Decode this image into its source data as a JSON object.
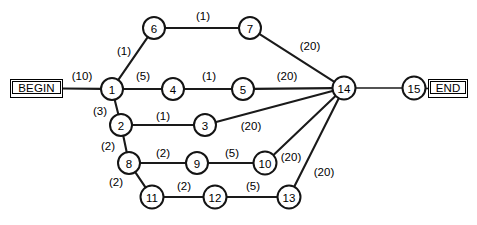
{
  "diagram": {
    "terminals": {
      "begin": {
        "label": "BEGIN",
        "x": 10,
        "y": 79,
        "w": 53,
        "h": 19
      },
      "end": {
        "label": "END",
        "x": 428,
        "y": 79,
        "w": 40,
        "h": 19
      }
    },
    "nodes": [
      {
        "id": "1",
        "label": "1",
        "x": 112,
        "y": 89,
        "r": 11
      },
      {
        "id": "2",
        "label": "2",
        "x": 121,
        "y": 125,
        "r": 11
      },
      {
        "id": "3",
        "label": "3",
        "x": 205,
        "y": 125,
        "r": 11
      },
      {
        "id": "4",
        "label": "4",
        "x": 173,
        "y": 89,
        "r": 11
      },
      {
        "id": "5",
        "label": "5",
        "x": 243,
        "y": 89,
        "r": 11
      },
      {
        "id": "6",
        "label": "6",
        "x": 154,
        "y": 28,
        "r": 11
      },
      {
        "id": "7",
        "label": "7",
        "x": 250,
        "y": 28,
        "r": 11
      },
      {
        "id": "8",
        "label": "8",
        "x": 129,
        "y": 163,
        "r": 11
      },
      {
        "id": "9",
        "label": "9",
        "x": 197,
        "y": 163,
        "r": 11
      },
      {
        "id": "10",
        "label": "10",
        "x": 265,
        "y": 163,
        "r": 11.5
      },
      {
        "id": "11",
        "label": "11",
        "x": 152,
        "y": 197,
        "r": 11.5
      },
      {
        "id": "12",
        "label": "12",
        "x": 215,
        "y": 197,
        "r": 11.5
      },
      {
        "id": "13",
        "label": "13",
        "x": 289,
        "y": 197,
        "r": 11.5
      },
      {
        "id": "14",
        "label": "14",
        "x": 344,
        "y": 88,
        "r": 11.5
      },
      {
        "id": "15",
        "label": "15",
        "x": 414,
        "y": 88,
        "r": 11.5
      }
    ],
    "edges": [
      {
        "from": "BEGIN",
        "to": "1",
        "weight": "(10)",
        "lx": 82,
        "ly": 76
      },
      {
        "from": "1",
        "to": "6",
        "weight": "(1)",
        "lx": 124,
        "ly": 51
      },
      {
        "from": "6",
        "to": "7",
        "weight": "(1)",
        "lx": 203,
        "ly": 16
      },
      {
        "from": "7",
        "to": "14",
        "weight": "(20)",
        "lx": 310,
        "ly": 46
      },
      {
        "from": "1",
        "to": "4",
        "weight": "(5)",
        "lx": 143,
        "ly": 76
      },
      {
        "from": "4",
        "to": "5",
        "weight": "(1)",
        "lx": 209,
        "ly": 76
      },
      {
        "from": "5",
        "to": "14",
        "weight": "(20)",
        "lx": 287,
        "ly": 76
      },
      {
        "from": "1",
        "to": "2",
        "weight": "(3)",
        "lx": 100,
        "ly": 111
      },
      {
        "from": "2",
        "to": "3",
        "weight": "(1)",
        "lx": 163,
        "ly": 116
      },
      {
        "from": "3",
        "to": "14",
        "weight": "(20)",
        "lx": 251,
        "ly": 126
      },
      {
        "from": "2",
        "to": "8",
        "weight": "(2)",
        "lx": 108,
        "ly": 146
      },
      {
        "from": "8",
        "to": "9",
        "weight": "(2)",
        "lx": 163,
        "ly": 153
      },
      {
        "from": "9",
        "to": "10",
        "weight": "(5)",
        "lx": 232,
        "ly": 153
      },
      {
        "from": "10",
        "to": "14",
        "weight": "(20)",
        "lx": 291,
        "ly": 157
      },
      {
        "from": "8",
        "to": "11",
        "weight": "(2)",
        "lx": 116,
        "ly": 182
      },
      {
        "from": "11",
        "to": "12",
        "weight": "(2)",
        "lx": 184,
        "ly": 186
      },
      {
        "from": "12",
        "to": "13",
        "weight": "(5)",
        "lx": 253,
        "ly": 186
      },
      {
        "from": "13",
        "to": "14",
        "weight": "(20)",
        "lx": 324,
        "ly": 172
      },
      {
        "from": "14",
        "to": "15",
        "weight": "",
        "lx": 379,
        "ly": 78
      },
      {
        "from": "15",
        "to": "END",
        "weight": "",
        "lx": 423,
        "ly": 78
      }
    ],
    "colors": {
      "stroke": "#141414",
      "node_fill": "#ffffff",
      "background": "#ffffff",
      "text": "#000000"
    }
  }
}
